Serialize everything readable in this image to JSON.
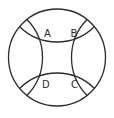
{
  "diagram": {
    "stroke_color": "#2b2b2b",
    "background": "#ffffff",
    "outer_circle": {
      "cx": 57,
      "cy": 57.5,
      "r": 48.5
    },
    "labels": {
      "A": "A",
      "B": "B",
      "C": "C",
      "D": "D"
    },
    "points": {
      "A": {
        "x": 40,
        "y": 38
      },
      "B": {
        "x": 76,
        "y": 38
      },
      "C": {
        "x": 76,
        "y": 77
      },
      "D": {
        "x": 40,
        "y": 77
      }
    }
  }
}
